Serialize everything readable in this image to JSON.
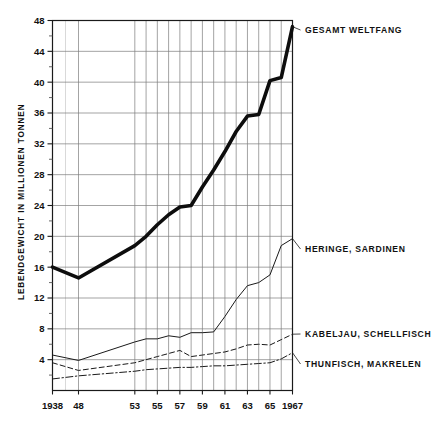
{
  "chart_data": {
    "type": "line",
    "title": "",
    "subtitle": "",
    "xlabel": "",
    "ylabel": "LEBENDGEWICHT IN MILLIONEN TONNEN",
    "xlim": [
      1938,
      1967
    ],
    "ylim": [
      0,
      48
    ],
    "y_ticks": [
      4,
      8,
      12,
      16,
      20,
      24,
      28,
      32,
      36,
      40,
      44,
      48
    ],
    "y_tick_labels": [
      "4",
      "8",
      "12",
      "16",
      "20",
      "24",
      "28",
      "32",
      "36",
      "40",
      "44",
      "48"
    ],
    "y_minor_ticks": [
      2,
      6,
      10,
      14,
      18,
      22,
      26,
      30,
      34,
      38,
      42,
      46
    ],
    "x_ticks": [
      1938,
      1948,
      1953,
      1955,
      1957,
      1959,
      1961,
      1963,
      1965,
      1967
    ],
    "x_tick_labels": [
      "1938",
      "48",
      "53",
      "55",
      "57",
      "59",
      "61",
      "63",
      "65",
      "1967"
    ],
    "x_gridlines": [
      1948,
      1953,
      1954,
      1955,
      1956,
      1957,
      1958,
      1959,
      1960,
      1961,
      1962,
      1963,
      1964,
      1965,
      1966,
      1967
    ],
    "grid": true,
    "legend_position": "right-inline",
    "series": [
      {
        "name": "GESAMT WELTFANG",
        "style": "thick-solid",
        "color": "#0d0d0d",
        "width": 3.6,
        "x": [
          1938,
          1948,
          1953,
          1954,
          1955,
          1956,
          1957,
          1958,
          1959,
          1960,
          1961,
          1962,
          1963,
          1964,
          1965,
          1966,
          1967
        ],
        "values": [
          16.0,
          14.6,
          18.8,
          20.0,
          21.5,
          22.8,
          23.8,
          24.0,
          26.4,
          28.6,
          31.0,
          33.6,
          35.6,
          35.8,
          40.2,
          40.6,
          47.2
        ]
      },
      {
        "name": "HERINGE, SARDINEN",
        "style": "thin-solid",
        "color": "#1a1a1a",
        "width": 1.0,
        "x": [
          1938,
          1948,
          1953,
          1954,
          1955,
          1956,
          1957,
          1958,
          1959,
          1960,
          1961,
          1962,
          1963,
          1964,
          1965,
          1966,
          1967
        ],
        "values": [
          4.6,
          3.9,
          6.3,
          6.7,
          6.7,
          7.1,
          6.9,
          7.5,
          7.5,
          7.6,
          9.6,
          11.8,
          13.6,
          14.0,
          15.0,
          18.8,
          19.7
        ]
      },
      {
        "name": "KABELJAU, SCHELLFISCH",
        "style": "dashed",
        "color": "#1a1a1a",
        "width": 1.0,
        "x": [
          1938,
          1948,
          1953,
          1954,
          1955,
          1956,
          1957,
          1958,
          1959,
          1960,
          1961,
          1962,
          1963,
          1964,
          1965,
          1966,
          1967
        ],
        "values": [
          3.6,
          2.6,
          3.6,
          4.0,
          4.4,
          4.8,
          5.2,
          4.4,
          4.6,
          4.8,
          5.0,
          5.4,
          5.9,
          6.0,
          5.9,
          6.6,
          7.3
        ]
      },
      {
        "name": "THUNFISCH, MAKRELEN",
        "style": "dash-dot",
        "color": "#1a1a1a",
        "width": 1.0,
        "x": [
          1938,
          1948,
          1953,
          1954,
          1955,
          1956,
          1957,
          1958,
          1959,
          1960,
          1961,
          1962,
          1963,
          1964,
          1965,
          1966,
          1967
        ],
        "values": [
          1.5,
          1.9,
          2.5,
          2.7,
          2.8,
          2.9,
          3.0,
          3.0,
          3.1,
          3.2,
          3.2,
          3.3,
          3.4,
          3.5,
          3.6,
          4.1,
          4.9
        ]
      }
    ],
    "annotations": [
      {
        "text": "GESAMT WELTFANG",
        "x": 1967,
        "y": 47.2
      },
      {
        "text": "HERINGE, SARDINEN",
        "x": 1967,
        "y": 19.7
      },
      {
        "text": "KABELJAU, SCHELLFISCH",
        "x": 1967,
        "y": 7.3
      },
      {
        "text": "THUNFISCH, MAKRELEN",
        "x": 1967,
        "y": 4.9
      }
    ]
  },
  "labels": {
    "y_axis_title": "LEBENDGEWICHT IN MILLIONEN TONNEN",
    "legend": {
      "gesamt": "GESAMT WELTFANG",
      "heringe": "HERINGE, SARDINEN",
      "kabeljau": "KABELJAU, SCHELLFISCH",
      "thunfisch": "THUNFISCH, MAKRELEN"
    },
    "y_ticks": {
      "t48": "48",
      "t44": "44",
      "t40": "40",
      "t36": "36",
      "t32": "32",
      "t28": "28",
      "t24": "24",
      "t20": "20",
      "t16": "16",
      "t12": "12",
      "t8": "8",
      "t4": "4"
    },
    "x_ticks": {
      "x1938": "1938",
      "x48": "48",
      "x53": "53",
      "x55": "55",
      "x57": "57",
      "x59": "59",
      "x61": "61",
      "x63": "63",
      "x65": "65",
      "x1967": "1967"
    }
  },
  "colors": {
    "background": "#ffffff",
    "grid_major": "#7d7d7d",
    "grid_minor": "#b9b9b9",
    "frame": "#1a1a1a",
    "ink": "#111111"
  }
}
